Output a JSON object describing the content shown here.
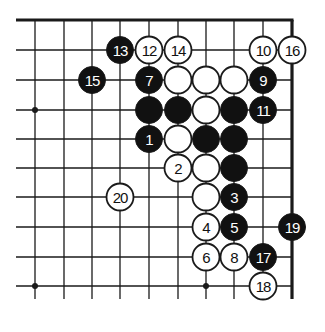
{
  "diagram": {
    "board_colors": {
      "background": "#ffffff",
      "line": "#1a1a1a",
      "black_stone": "#111111",
      "white_stone": "#ffffff",
      "black_label": "#ffffff",
      "white_label": "#111111"
    },
    "grid": {
      "columns": 10,
      "rows": 10,
      "edges": [
        "top",
        "right"
      ]
    },
    "star_points": [
      {
        "col": 0,
        "row": 3
      },
      {
        "col": 0,
        "row": 9
      },
      {
        "col": 6,
        "row": 9
      }
    ],
    "stones": [
      {
        "col": 3,
        "row": 1,
        "color": "black",
        "label": "13"
      },
      {
        "col": 4,
        "row": 1,
        "color": "white",
        "label": "12"
      },
      {
        "col": 5,
        "row": 1,
        "color": "white",
        "label": "14"
      },
      {
        "col": 8,
        "row": 1,
        "color": "white",
        "label": "10"
      },
      {
        "col": 9,
        "row": 1,
        "color": "white",
        "label": "16"
      },
      {
        "col": 2,
        "row": 2,
        "color": "black",
        "label": "15"
      },
      {
        "col": 4,
        "row": 2,
        "color": "black",
        "label": "7"
      },
      {
        "col": 5,
        "row": 2,
        "color": "white",
        "label": ""
      },
      {
        "col": 6,
        "row": 2,
        "color": "white",
        "label": ""
      },
      {
        "col": 7,
        "row": 2,
        "color": "white",
        "label": ""
      },
      {
        "col": 8,
        "row": 2,
        "color": "black",
        "label": "9"
      },
      {
        "col": 4,
        "row": 3,
        "color": "black",
        "label": ""
      },
      {
        "col": 5,
        "row": 3,
        "color": "black",
        "label": ""
      },
      {
        "col": 6,
        "row": 3,
        "color": "white",
        "label": ""
      },
      {
        "col": 7,
        "row": 3,
        "color": "black",
        "label": ""
      },
      {
        "col": 8,
        "row": 3,
        "color": "black",
        "label": "11"
      },
      {
        "col": 4,
        "row": 4,
        "color": "black",
        "label": "1"
      },
      {
        "col": 5,
        "row": 4,
        "color": "white",
        "label": ""
      },
      {
        "col": 6,
        "row": 4,
        "color": "black",
        "label": ""
      },
      {
        "col": 7,
        "row": 4,
        "color": "black",
        "label": ""
      },
      {
        "col": 5,
        "row": 5,
        "color": "white",
        "label": "2"
      },
      {
        "col": 6,
        "row": 5,
        "color": "white",
        "label": ""
      },
      {
        "col": 7,
        "row": 5,
        "color": "black",
        "label": ""
      },
      {
        "col": 3,
        "row": 6,
        "color": "white",
        "label": "20"
      },
      {
        "col": 6,
        "row": 6,
        "color": "white",
        "label": ""
      },
      {
        "col": 7,
        "row": 6,
        "color": "black",
        "label": "3"
      },
      {
        "col": 6,
        "row": 7,
        "color": "white",
        "label": "4"
      },
      {
        "col": 7,
        "row": 7,
        "color": "black",
        "label": "5"
      },
      {
        "col": 9,
        "row": 7,
        "color": "black",
        "label": "19"
      },
      {
        "col": 6,
        "row": 8,
        "color": "white",
        "label": "6"
      },
      {
        "col": 7,
        "row": 8,
        "color": "white",
        "label": "8"
      },
      {
        "col": 8,
        "row": 8,
        "color": "black",
        "label": "17"
      },
      {
        "col": 8,
        "row": 9,
        "color": "white",
        "label": "18"
      }
    ]
  }
}
